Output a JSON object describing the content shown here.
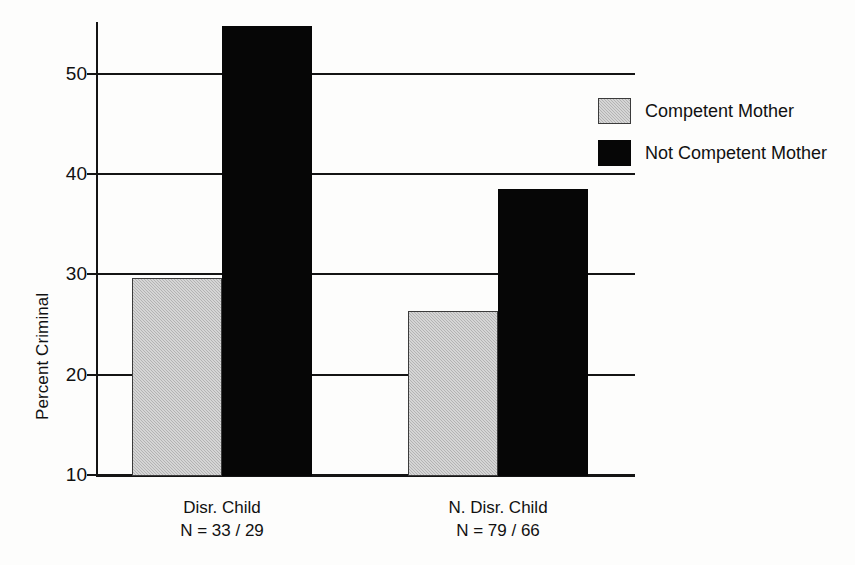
{
  "chart_data": {
    "type": "bar",
    "title": "",
    "xlabel": "",
    "ylabel": "Percent Criminal",
    "ylim": [
      10,
      55.5
    ],
    "yticks": [
      10,
      20,
      30,
      40,
      50
    ],
    "ytick_labels": [
      "10",
      "20",
      "30",
      "40",
      "50"
    ],
    "grid": true,
    "legend_position": "right",
    "categories": [
      "Disr. Child",
      "N. Disr. Child"
    ],
    "category_sublabels": [
      "N = 33 / 29",
      "N = 79 / 66"
    ],
    "series": [
      {
        "name": "Competent Mother",
        "color": "#b3b3b3",
        "values": [
          29.6,
          26.4
        ]
      },
      {
        "name": "Not Competent Mother",
        "color": "#060606",
        "values": [
          54.8,
          38.5
        ]
      }
    ]
  },
  "axis": {
    "y_title": "Percent Criminal",
    "ticks": [
      {
        "label": "50",
        "value": 50
      },
      {
        "label": "40",
        "value": 40
      },
      {
        "label": "30",
        "value": 30
      },
      {
        "label": "20",
        "value": 20
      },
      {
        "label": "10",
        "value": 10
      }
    ]
  },
  "groups": [
    {
      "name": "Disr. Child",
      "n_label": "N = 33 / 29",
      "bars": [
        {
          "series": "Competent Mother",
          "value": 29.6
        },
        {
          "series": "Not Competent Mother",
          "value": 54.8
        }
      ]
    },
    {
      "name": "N. Disr. Child",
      "n_label": "N = 79 / 66",
      "bars": [
        {
          "series": "Competent Mother",
          "value": 26.4
        },
        {
          "series": "Not Competent Mother",
          "value": 38.5
        }
      ]
    }
  ],
  "legend": {
    "items": [
      {
        "label": "Competent Mother",
        "swatch": "competent"
      },
      {
        "label": "Not Competent Mother",
        "swatch": "notcompetent"
      }
    ]
  }
}
